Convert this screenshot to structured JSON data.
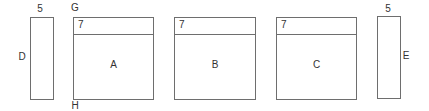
{
  "diagram": {
    "stroke_color": "#6e6e6e",
    "text_color": "#333333",
    "side_panels": [
      {
        "id": "D",
        "label": "D",
        "width_label": "5"
      },
      {
        "id": "E",
        "label": "E",
        "width_label": "5"
      }
    ],
    "main_panels": [
      {
        "id": "A",
        "label": "A",
        "header_label": "7"
      },
      {
        "id": "B",
        "label": "B",
        "header_label": "7"
      },
      {
        "id": "C",
        "label": "C",
        "header_label": "7"
      }
    ],
    "markers": {
      "top": "G",
      "bottom": "H"
    }
  }
}
